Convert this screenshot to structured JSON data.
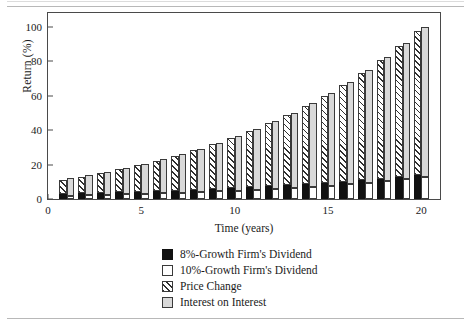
{
  "chart_data": {
    "type": "bar",
    "subtype": "grouped-stacked",
    "title": "",
    "xlabel": "Time (years)",
    "ylabel": "Return (%)",
    "xlim": [
      0,
      21
    ],
    "ylim": [
      0,
      108
    ],
    "xticks": [
      0,
      5,
      10,
      15,
      20
    ],
    "yticks": [
      0,
      20,
      40,
      60,
      80,
      100
    ],
    "grid": false,
    "legend_position": "below-center",
    "categories": [
      1,
      2,
      3,
      4,
      5,
      6,
      7,
      8,
      9,
      10,
      11,
      12,
      13,
      14,
      15,
      16,
      17,
      18,
      19,
      20
    ],
    "series": [
      {
        "name": "8%-Growth Firm's Dividend",
        "swatch": "black",
        "bar": "left",
        "position": "bottom",
        "values": [
          3.0,
          3.3,
          3.6,
          3.9,
          4.2,
          4.5,
          4.9,
          5.3,
          5.8,
          6.3,
          6.8,
          7.4,
          8.0,
          8.6,
          9.3,
          10.1,
          10.9,
          11.8,
          12.7,
          13.7
        ]
      },
      {
        "name": "Price Change",
        "swatch": "hatch",
        "bar": "left",
        "position": "top",
        "values": [
          8.0,
          9.6,
          11.4,
          13.3,
          15.4,
          17.7,
          20.2,
          22.9,
          25.9,
          29.2,
          32.7,
          36.6,
          40.9,
          45.5,
          50.6,
          56.2,
          62.3,
          68.9,
          76.2,
          84.1
        ]
      },
      {
        "name": "10%-Growth Firm's Dividend",
        "swatch": "white",
        "bar": "right",
        "position": "bottom",
        "values": [
          2.0,
          2.2,
          2.4,
          2.7,
          3.0,
          3.3,
          3.6,
          4.0,
          4.4,
          4.8,
          5.3,
          5.9,
          6.5,
          7.1,
          7.8,
          8.6,
          9.5,
          10.5,
          11.5,
          12.7
        ]
      },
      {
        "name": "Interest on Interest",
        "swatch": "gray",
        "bar": "right",
        "position": "top",
        "values": [
          10.0,
          11.6,
          13.4,
          15.3,
          17.5,
          19.8,
          22.4,
          25.2,
          28.3,
          31.6,
          35.3,
          39.3,
          43.7,
          48.4,
          53.6,
          59.3,
          65.4,
          72.1,
          79.3,
          87.3
        ]
      }
    ],
    "totals_left": [
      11.0,
      12.9,
      15.0,
      17.2,
      19.6,
      22.2,
      25.1,
      28.2,
      31.7,
      35.5,
      39.5,
      44.0,
      48.9,
      54.1,
      59.9,
      66.3,
      73.2,
      80.7,
      88.9,
      97.8
    ],
    "totals_right": [
      12.0,
      13.8,
      15.8,
      18.0,
      20.5,
      23.1,
      26.0,
      29.2,
      32.7,
      36.4,
      40.6,
      45.2,
      50.2,
      55.5,
      61.4,
      67.9,
      74.9,
      82.6,
      90.8,
      100.0
    ]
  },
  "axes": {
    "y_title": "Return (%)",
    "x_title": "Time (years)",
    "y_ticks": [
      "0",
      "20",
      "40",
      "60",
      "80",
      "100"
    ],
    "x_ticks": [
      "0",
      "5",
      "10",
      "15",
      "20"
    ]
  },
  "legend": {
    "items": [
      {
        "label": "8%-Growth Firm's Dividend",
        "swatch": "black"
      },
      {
        "label": "10%-Growth Firm's Dividend",
        "swatch": "white"
      },
      {
        "label": "Price Change",
        "swatch": "hatch"
      },
      {
        "label": "Interest on Interest",
        "swatch": "gray"
      }
    ]
  },
  "colors": {
    "black": "#111111",
    "white": "#ffffff",
    "gray": "#d9d9d9",
    "hatch_line": "#2f2f2f",
    "frame": "#4a4a4a",
    "rule": "#b8b8b8"
  }
}
